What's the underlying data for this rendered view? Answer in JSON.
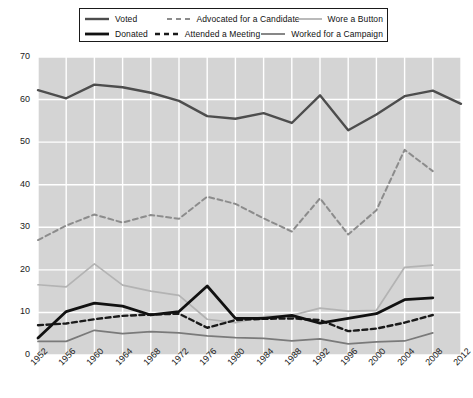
{
  "legend": {
    "position": "top-center",
    "entries": [
      {
        "label": "Voted",
        "icon": "solid-line-swatch",
        "style": "solid",
        "color": "#4d4d4d",
        "width": 2.4
      },
      {
        "label": "Advocated for a Candidate",
        "icon": "dashed-line-swatch",
        "style": "dashed",
        "color": "#8c8c8c",
        "width": 2.0
      },
      {
        "label": "Wore a Button",
        "icon": "solid-line-swatch",
        "style": "solid",
        "color": "#b3b3b3",
        "width": 1.8
      },
      {
        "label": "Donated",
        "icon": "solid-line-swatch",
        "style": "solid",
        "color": "#111111",
        "width": 2.6
      },
      {
        "label": "Attended a Meeting",
        "icon": "dashed-line-swatch",
        "style": "dashed",
        "color": "#1a1a1a",
        "width": 2.2
      },
      {
        "label": "Worked for a Campaign",
        "icon": "solid-line-swatch",
        "style": "solid",
        "color": "#7a7a7a",
        "width": 1.8
      }
    ]
  },
  "axes": {
    "y_ticks": [
      "0",
      "10",
      "20",
      "30",
      "40",
      "50",
      "60",
      "70"
    ],
    "x_ticks": [
      "1952",
      "1956",
      "1960",
      "1964",
      "1968",
      "1972",
      "1976",
      "1980",
      "1984",
      "1988",
      "1992",
      "1996",
      "2000",
      "2004",
      "2008",
      "2012"
    ]
  },
  "colors": {
    "plot_background": "#d4d4d4",
    "gridline": "#ffffff",
    "text": "#1a1a1a",
    "voted": "#4d4d4d",
    "advocated": "#8c8c8c",
    "wore_button": "#b3b3b3",
    "donated": "#111111",
    "attended_meeting": "#1a1a1a",
    "worked_campaign": "#7a7a7a"
  },
  "chart_data": {
    "type": "line",
    "title": "",
    "subtitle": "",
    "xlabel": "",
    "ylabel": "",
    "xlim": [
      1952,
      2012
    ],
    "ylim": [
      0,
      70
    ],
    "grid": true,
    "legend_position": "top-center",
    "categories": [
      1952,
      1956,
      1960,
      1964,
      1968,
      1972,
      1976,
      1980,
      1984,
      1988,
      1992,
      1996,
      2000,
      2004,
      2008,
      2012
    ],
    "series": [
      {
        "name": "Voted",
        "color": "#4d4d4d",
        "style": "solid",
        "values": [
          62.2,
          60.3,
          63.5,
          62.9,
          61.6,
          59.7,
          56.1,
          55.5,
          56.8,
          54.5,
          61.0,
          52.8,
          56.5,
          60.8,
          62.1,
          59.0
        ]
      },
      {
        "name": "Advocated for a Candidate",
        "color": "#8c8c8c",
        "style": "dashed",
        "values": [
          27.0,
          30.4,
          33.0,
          31.1,
          32.9,
          32.0,
          37.2,
          35.5,
          32.1,
          29.0,
          36.8,
          28.3,
          34.0,
          48.2,
          43.2,
          null
        ]
      },
      {
        "name": "Wore a Button",
        "color": "#b3b3b3",
        "style": "solid",
        "values": [
          16.5,
          16.0,
          21.4,
          16.4,
          15.0,
          14.0,
          8.4,
          7.6,
          9.0,
          9.3,
          11.0,
          10.3,
          10.5,
          20.6,
          21.1,
          null
        ]
      },
      {
        "name": "Donated",
        "color": "#111111",
        "style": "solid",
        "values": [
          4.0,
          10.2,
          12.2,
          11.5,
          9.4,
          10.2,
          16.2,
          8.6,
          8.6,
          9.3,
          7.5,
          8.6,
          9.7,
          13.0,
          13.4,
          null
        ]
      },
      {
        "name": "Attended a Meeting",
        "color": "#1a1a1a",
        "style": "dashed",
        "values": [
          7.0,
          7.4,
          8.4,
          9.2,
          9.5,
          9.7,
          6.4,
          8.2,
          8.5,
          8.6,
          8.2,
          5.6,
          6.2,
          7.6,
          9.4,
          null
        ]
      },
      {
        "name": "Worked for a Campaign",
        "color": "#7a7a7a",
        "style": "solid",
        "values": [
          3.2,
          3.2,
          5.8,
          5.0,
          5.5,
          5.2,
          4.5,
          4.1,
          3.9,
          3.3,
          3.8,
          2.6,
          3.1,
          3.3,
          5.2,
          null
        ]
      }
    ]
  }
}
